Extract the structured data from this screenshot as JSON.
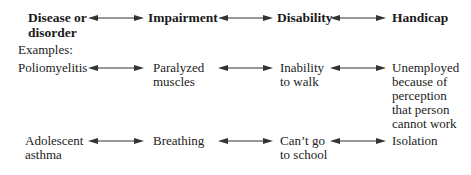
{
  "header": {
    "col1_line1": "Disease or",
    "col1_line2": "disorder",
    "col2": "Impairment",
    "col3": "Disability",
    "col4": "Handicap"
  },
  "examples_label": "Examples:",
  "rows": [
    {
      "disease": [
        "Poliomyelitis"
      ],
      "impairment": [
        "Paralyzed",
        "muscles"
      ],
      "disability": [
        "Inability",
        "to walk"
      ],
      "handicap": [
        "Unemployed",
        "because of",
        "perception",
        "that person",
        "cannot work"
      ]
    },
    {
      "disease": [
        "Adolescent",
        "asthma"
      ],
      "impairment": [
        "Breathing"
      ],
      "disability": [
        "Can’t go",
        "to school"
      ],
      "handicap": [
        "Isolation"
      ]
    }
  ],
  "icons": {
    "connector": "double-headed-arrow"
  },
  "colors": {
    "text": "#222222",
    "arrow": "#333333",
    "background": "#ffffff"
  }
}
